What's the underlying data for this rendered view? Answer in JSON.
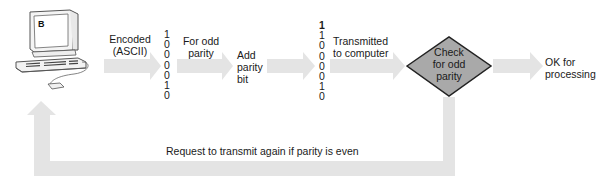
{
  "diagram": {
    "computer": {
      "screen_letter": "B"
    },
    "steps": {
      "encoded_label": [
        "Encoded",
        "(ASCII)"
      ],
      "ascii_bits": [
        "1",
        "0",
        "0",
        "0",
        "0",
        "1",
        "0"
      ],
      "odd_parity_label": [
        "For odd",
        "parity"
      ],
      "add_parity_label": [
        "Add",
        "parity",
        "bit"
      ],
      "parity_bits": [
        "1",
        "1",
        "0",
        "0",
        "0",
        "0",
        "1",
        "0"
      ],
      "transmitted_label": [
        "Transmitted",
        "to computer"
      ],
      "decision_label": [
        "Check",
        "for odd",
        "parity"
      ],
      "ok_label": [
        "OK for",
        "processing"
      ],
      "feedback_label": "Request to transmit again if parity is even"
    },
    "colors": {
      "arrow_fill": "#e4e4e4",
      "diamond_fill": "#a9a9a9",
      "diamond_stroke": "#222222",
      "text": "#1a1a1a"
    }
  }
}
